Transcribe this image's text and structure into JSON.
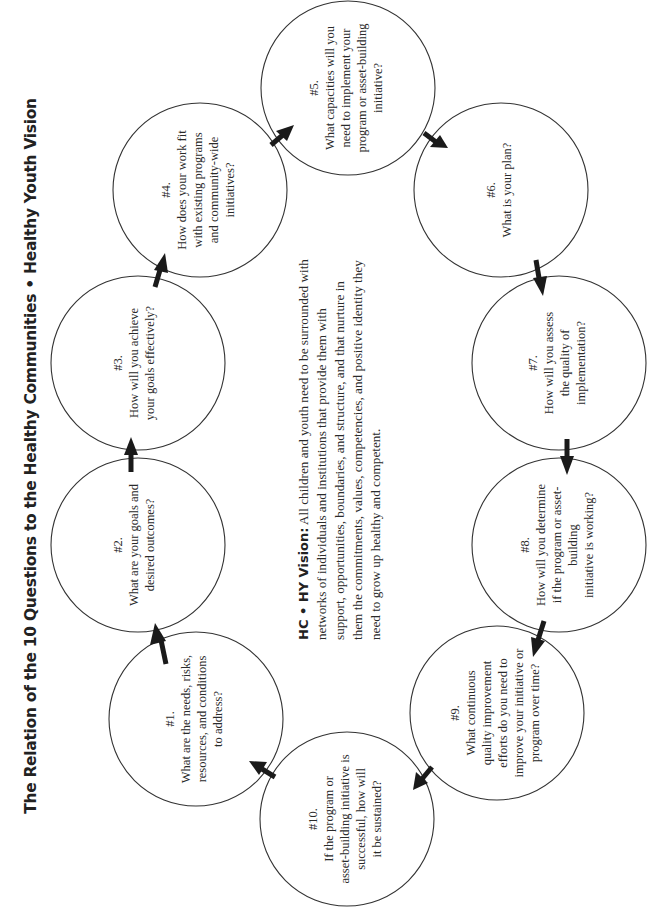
{
  "title": "The Relation of the 10 Questions to the Healthy Communities • Healthy Youth Vision",
  "vision": {
    "label": "HC • HY Vision:",
    "first_line_rest": " All children and youth need to be surrounded with",
    "lines": [
      "networks of individuals and institutions that provide them with",
      "support, opportunities, boundaries, and structure, and that nurture in",
      "them the commitments, values, competencies, and positive identity they",
      "need to grow up healthy and competent."
    ]
  },
  "questions": [
    {
      "number": "#1.",
      "lines": [
        "What are the needs, risks,",
        "resources, and conditions",
        "to address?"
      ]
    },
    {
      "number": "#2.",
      "lines": [
        "What are your goals and",
        "desired outcomes?"
      ]
    },
    {
      "number": "#3.",
      "lines": [
        "How will you achieve",
        "your goals effectively?"
      ]
    },
    {
      "number": "#4.",
      "lines": [
        "How does your work fit",
        "with existing programs",
        "and community-wide",
        "initiatives?"
      ]
    },
    {
      "number": "#5.",
      "lines": [
        "What capacities will you",
        "need to implement your",
        "program or asset-building",
        "initiative?"
      ]
    },
    {
      "number": "#6.",
      "lines": [
        "What is your plan?"
      ]
    },
    {
      "number": "#7.",
      "lines": [
        "How will you assess",
        "the quality of",
        "implementation?"
      ]
    },
    {
      "number": "#8.",
      "lines": [
        "How will you determine",
        "if the program or asset-",
        "building",
        "initiative is working?"
      ]
    },
    {
      "number": "#9.",
      "lines": [
        "What continuous",
        "quality improvement",
        "efforts do you need to",
        "improve your initiative or",
        "program over time?"
      ]
    },
    {
      "number": "#10.",
      "lines": [
        "If the program or",
        "asset-building initiative is",
        "successful, how will",
        "it be sustained?"
      ]
    }
  ],
  "flow": [
    "#1 → #2",
    "#2 → #3",
    "#3 → #4",
    "#4 → #5",
    "#5 → #6",
    "#6 → #7",
    "#7 → #8",
    "#8 → #9",
    "#9 → #10",
    "#10 → #1"
  ],
  "colors": {
    "stroke": "#333333",
    "text": "#2a2a2a",
    "arrow": "#1a1a1a",
    "background": "#ffffff"
  }
}
